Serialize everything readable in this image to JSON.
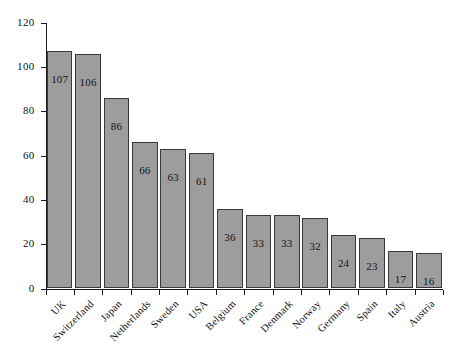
{
  "chart_data": {
    "type": "bar",
    "title": "",
    "subtitle": "",
    "xlabel": "",
    "ylabel": "",
    "ylim": [
      0,
      120
    ],
    "yticks": [
      0,
      20,
      40,
      60,
      80,
      100,
      120
    ],
    "grid": false,
    "legend": null,
    "orientation": "vertical",
    "bar_color": "#9d9d9d",
    "bar_edge_color": "#3a3a3a",
    "axis_color": "#1a1a1a",
    "categories": [
      "UK",
      "Switzerland",
      "Japan",
      "Netherlands",
      "Sweden",
      "USA",
      "Belgium",
      "France",
      "Denmark",
      "Norway",
      "Germany",
      "Spain",
      "Italy",
      "Austria"
    ],
    "values": [
      107,
      106,
      86,
      66,
      63,
      61,
      36,
      33,
      33,
      32,
      24,
      23,
      17,
      16
    ],
    "data_labels": [
      "107",
      "106",
      "86",
      "66",
      "63",
      "61",
      "36",
      "33",
      "33",
      "32",
      "24",
      "23",
      "17",
      "16"
    ],
    "ytick_labels": [
      "0",
      "20",
      "40",
      "60",
      "80",
      "100",
      "120"
    ]
  }
}
